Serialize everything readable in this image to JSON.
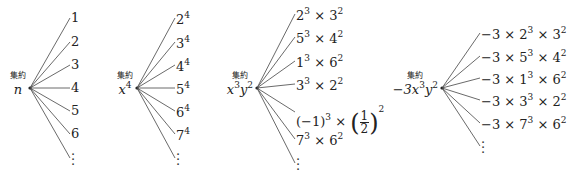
{
  "tag_label": "集約",
  "trees": [
    {
      "root": {
        "html": "<i>n</i>"
      },
      "root_text": "n",
      "root_pos": [
        30,
        88
      ],
      "label_x": 4,
      "leaf_x": 70,
      "leaves": [
        "1",
        "2",
        "3",
        "4",
        "5",
        "6"
      ],
      "leaves_html": [
        "1",
        "2",
        "3",
        "4",
        "5",
        "6"
      ],
      "ys": [
        18,
        42,
        65,
        88,
        111,
        134
      ],
      "dots_y": 158
    },
    {
      "root": {
        "html": "<i>x</i><sup>4</sup>"
      },
      "root_text": "x^4",
      "root_pos": [
        137,
        88
      ],
      "label_x": 107,
      "leaf_x": 175,
      "leaves": [
        "2^4",
        "3^4",
        "4^4",
        "5^4",
        "6^4",
        "7^4"
      ],
      "leaves_html": [
        "2<sup>4</sup>",
        "3<sup>4</sup>",
        "4<sup>4</sup>",
        "5<sup>4</sup>",
        "6<sup>4</sup>",
        "7<sup>4</sup>"
      ],
      "ys": [
        18,
        42,
        65,
        88,
        111,
        134
      ],
      "dots_y": 158
    },
    {
      "root": {
        "html": "<i>x</i><sup>3</sup><i>y</i><sup>2</sup>"
      },
      "root_text": "x^3y^2",
      "root_pos": [
        257,
        88
      ],
      "label_x": 227,
      "leaf_x": 295,
      "leaves": [
        "2^3 × 3^2",
        "5^3 × 4^2",
        "1^3 × 6^2",
        "3^3 × 2^2",
        "(−1)^3 × (1/2)^2",
        "7^3 × 6^2"
      ],
      "leaves_html": [
        "2<sup>3</sup> × 3<sup>2</sup>",
        "5<sup>3</sup> × 4<sup>2</sup>",
        "1<sup>3</sup> × 6<sup>2</sup>",
        "3<sup>3</sup> × 2<sup>2</sup>",
        "(−1)<sup>3</sup> × <span class='paren'>(</span><span class='frac'><span class='n'>1</span><span class='d'>2</span></span><span class='paren'>)</span><sup style='vertical-align:14px'>2</sup>",
        "7<sup>3</sup> × 6<sup>2</sup>"
      ],
      "ys": [
        14,
        37,
        61,
        84,
        112,
        139
      ],
      "dots_y": 163
    },
    {
      "root": {
        "html": "−3<i>x</i><sup>3</sup><i>y</i><sup>2</sup>"
      },
      "root_text": "−3x^3y^2",
      "root_pos": [
        442,
        88
      ],
      "label_x": 398,
      "leaf_x": 480,
      "leaves": [
        "−3 × 2^3 × 3^2",
        "−3 × 5^3 × 4^2",
        "−3 × 1^3 × 6^2",
        "−3 × 3^3 × 2^2",
        "−3 × 7^3 × 6^2"
      ],
      "leaves_html": [
        "−3 × 2<sup>3</sup> × 3<sup>2</sup>",
        "−3 × 5<sup>3</sup> × 4<sup>2</sup>",
        "−3 × 1<sup>3</sup> × 6<sup>2</sup>",
        "−3 × 3<sup>3</sup> × 2<sup>2</sup>",
        "−3 × 7<sup>3</sup> × 6<sup>2</sup>"
      ],
      "ys": [
        33,
        56,
        78,
        100,
        123
      ],
      "dots_y": 146
    }
  ]
}
